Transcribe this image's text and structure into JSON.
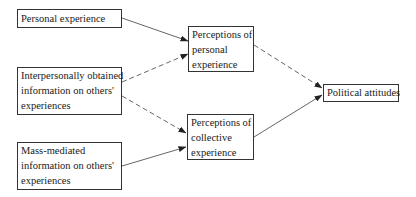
{
  "nodes": {
    "personal_experience": {
      "lines": [
        "Personal experience"
      ]
    },
    "interpersonal_info": {
      "lines": [
        "Interpersonally obtained",
        "information on others'",
        "experiences"
      ]
    },
    "mass_mediated_info": {
      "lines": [
        "Mass-mediated",
        "information on others'",
        "experiences"
      ]
    },
    "perceptions_personal": {
      "lines": [
        "Perceptions of",
        "personal",
        "experience"
      ]
    },
    "perceptions_collective": {
      "lines": [
        "Perceptions of",
        "collective",
        "experience"
      ]
    },
    "political_attitudes": {
      "lines": [
        "Political attitudes"
      ]
    }
  },
  "edges": [
    {
      "from": "personal_experience",
      "to": "perceptions_personal",
      "style": "solid"
    },
    {
      "from": "interpersonal_info",
      "to": "perceptions_personal",
      "style": "dashed"
    },
    {
      "from": "interpersonal_info",
      "to": "perceptions_collective",
      "style": "dashed"
    },
    {
      "from": "mass_mediated_info",
      "to": "perceptions_collective",
      "style": "solid"
    },
    {
      "from": "perceptions_personal",
      "to": "political_attitudes",
      "style": "dashed"
    },
    {
      "from": "perceptions_collective",
      "to": "political_attitudes",
      "style": "solid"
    }
  ],
  "colors": {
    "line": "#333333",
    "text": "#1a1a1a",
    "background": "#ffffff"
  }
}
